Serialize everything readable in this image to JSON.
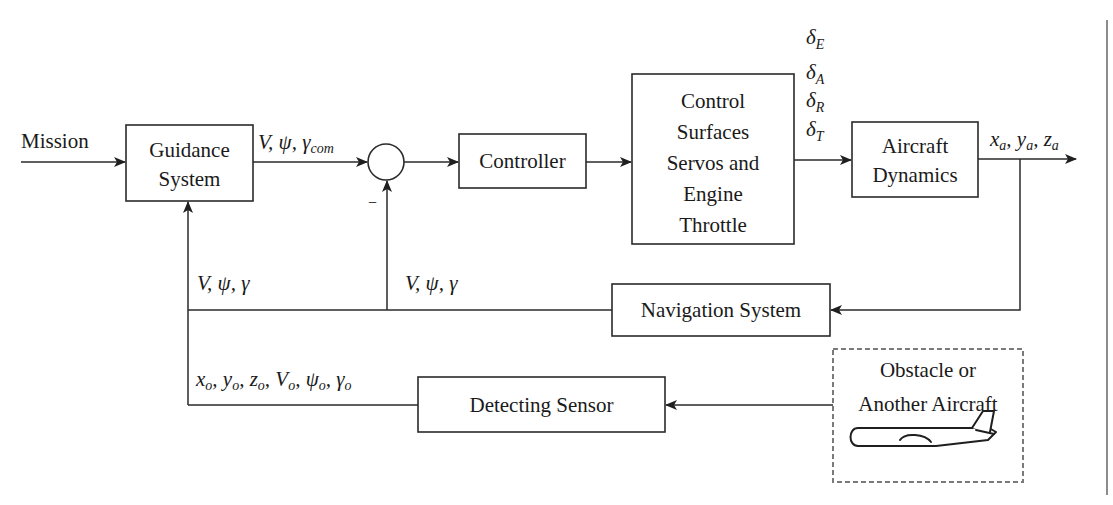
{
  "diagram": {
    "blocks": {
      "guidance": {
        "line1": "Guidance",
        "line2": "System"
      },
      "controller": {
        "label": "Controller"
      },
      "actuators": {
        "line1": "Control",
        "line2": "Surfaces",
        "line3": "Servos and",
        "line4": "Engine",
        "line5": "Throttle"
      },
      "aircraft_dynamics": {
        "line1": "Aircraft",
        "line2": "Dynamics"
      },
      "navigation": {
        "label": "Navigation System"
      },
      "detecting_sensor": {
        "label": "Detecting Sensor"
      },
      "obstacle": {
        "line1": "Obstacle or",
        "line2": "Another Aircraft"
      }
    },
    "signals": {
      "mission": "Mission",
      "command": {
        "main": "V, ψ, γ",
        "sub": "com"
      },
      "summing_sign": "−",
      "control_inputs": [
        {
          "main": "δ",
          "sub": "E"
        },
        {
          "main": "δ",
          "sub": "A"
        },
        {
          "main": "δ",
          "sub": "R"
        },
        {
          "main": "δ",
          "sub": "T"
        }
      ],
      "aircraft_position": [
        {
          "main": "x",
          "sub": "a",
          "sep": ", "
        },
        {
          "main": "y",
          "sub": "a",
          "sep": ", "
        },
        {
          "main": "z",
          "sub": "a",
          "sep": ""
        }
      ],
      "feedback_guidance": "V, ψ, γ",
      "feedback_sum": "V, ψ, γ",
      "obstacle_state": [
        {
          "main": "x",
          "sub": "o",
          "sep": ", "
        },
        {
          "main": "y",
          "sub": "o",
          "sep": ", "
        },
        {
          "main": "z",
          "sub": "o",
          "sep": ", "
        },
        {
          "main": "V",
          "sub": "o",
          "sep": ", "
        },
        {
          "main": "ψ",
          "sub": "o",
          "sep": ", "
        },
        {
          "main": "γ",
          "sub": "o",
          "sep": ""
        }
      ]
    },
    "icons": {
      "obstacle_icon": "airplane-icon"
    },
    "colors": {
      "line": "#2a2a2a",
      "dashed_border": "#7a7a7a",
      "page_edge": "#8c8c8c",
      "background": "#ffffff"
    }
  }
}
